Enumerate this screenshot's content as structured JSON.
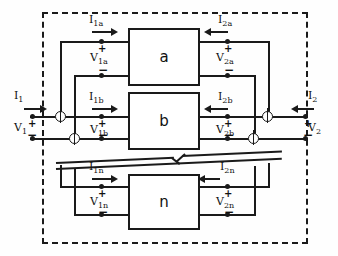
{
  "diagram": {
    "blocks": [
      {
        "id": "a",
        "label": "a"
      },
      {
        "id": "b",
        "label": "b"
      },
      {
        "id": "n",
        "label": "n"
      }
    ],
    "labels": {
      "i1": "I",
      "i1_sub": "1",
      "v1": "V",
      "v1_sub": "1",
      "i2": "I",
      "i2_sub": "2",
      "v2": "V",
      "v2_sub": "2",
      "i1a": "I",
      "i1a_sub": "1a",
      "v1a": "V",
      "v1a_sub": "1a",
      "i2a": "I",
      "i2a_sub": "2a",
      "v2a": "V",
      "v2a_sub": "2a",
      "i1b": "I",
      "i1b_sub": "1b",
      "v1b": "V",
      "v1b_sub": "1b",
      "i2b": "I",
      "i2b_sub": "2b",
      "v2b": "V",
      "v2b_sub": "2b",
      "i1n": "I",
      "i1n_sub": "1n",
      "v1n": "V",
      "v1n_sub": "1n",
      "i2n": "I",
      "i2n_sub": "2n",
      "v2n": "V",
      "v2n_sub": "2n"
    },
    "polarity": {
      "plus": "+",
      "minus": "−"
    },
    "colors": {
      "line": "#1a1a1a",
      "background": "#fefefe"
    }
  }
}
